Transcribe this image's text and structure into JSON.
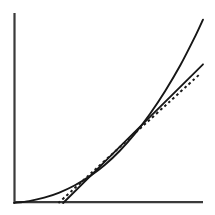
{
  "figure": {
    "background_color": "#ffffff",
    "ink_color": "#161616",
    "axis_color": "#3a3a3a",
    "width": 215,
    "height": 215
  },
  "chart_data": {
    "type": "line",
    "title": "",
    "subtitle": "",
    "xlabel": "",
    "ylabel": "",
    "grid": false,
    "legend_position": "none",
    "annotations": [],
    "axes": {
      "x_axis": {
        "visible": true,
        "tick_labels": [],
        "origin_px": [
          14,
          203
        ],
        "end_px": [
          203,
          203
        ],
        "color": "#3a3a3a"
      },
      "y_axis": {
        "visible": true,
        "tick_labels": [],
        "origin_px": [
          14,
          203
        ],
        "end_px": [
          14,
          13
        ],
        "color": "#3a3a3a"
      },
      "xlim": [
        0,
        1
      ],
      "ylim": [
        0,
        1
      ]
    },
    "series": [
      {
        "name": "convex-curve",
        "style": "solid",
        "color": "#161616",
        "description": "Smooth increasing convex curve rising from near the origin to the top-right",
        "x": [
          0.0,
          0.08,
          0.16,
          0.24,
          0.32,
          0.4,
          0.48,
          0.56,
          0.64,
          0.72,
          0.8,
          0.88,
          0.96,
          1.0
        ],
        "y": [
          0.0,
          0.01,
          0.028,
          0.055,
          0.092,
          0.14,
          0.2,
          0.275,
          0.365,
          0.47,
          0.59,
          0.725,
          0.88,
          0.965
        ]
      },
      {
        "name": "tangent-line",
        "style": "solid",
        "color": "#161616",
        "description": "Straight line tangent to the curve at the contact point, with a shallower slope",
        "x": [
          0.26,
          1.0
        ],
        "y": [
          0.0,
          0.73
        ]
      },
      {
        "name": "approximation-line",
        "style": "dashed",
        "color": "#1b1b1b",
        "description": "Dashed straight line just below the tangent line, crossing the axis slightly to the left",
        "x": [
          0.235,
          0.985
        ],
        "y": [
          0.0,
          0.68
        ]
      }
    ],
    "contact_point": {
      "x": 0.47,
      "y": 0.193,
      "px": [
        103,
        147
      ]
    }
  }
}
